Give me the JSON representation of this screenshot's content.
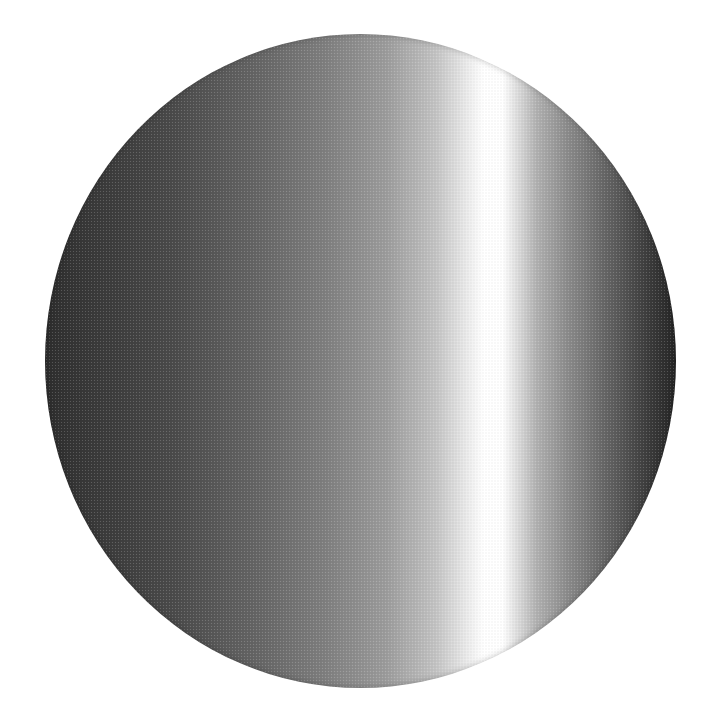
{
  "image": {
    "description": "Halftone-shaded disc with horizontal grayscale gradient and a vertical bright highlight band right of center",
    "shape": "ellipse",
    "bounds": {
      "left": 45,
      "top": 34,
      "right": 676,
      "bottom": 688
    },
    "highlight_band_x": [
      465,
      500
    ],
    "colors": {
      "background": "#ffffff",
      "dark_edge": "#2e2e2e",
      "mid_gray": "#7e7e7e",
      "highlight": "#ffffff"
    }
  }
}
